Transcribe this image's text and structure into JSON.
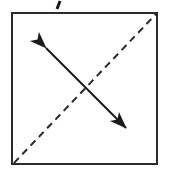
{
  "figure": {
    "canvas": {
      "width": 170,
      "height": 176,
      "background": "#ffffff"
    },
    "colors": {
      "stroke": "#1a1a1a",
      "square_border": "#2b2b2b",
      "dashed_line": "#2b2b2b",
      "arrow": "#1a1a1a",
      "background": "#ffffff"
    },
    "square": {
      "name": "square-outline",
      "x": 11,
      "y": 12,
      "width": 147,
      "height": 153,
      "stroke_width": 2,
      "fill": "none"
    },
    "dashed_diagonal": {
      "name": "dashed-diagonal",
      "x1": 14,
      "y1": 163,
      "x2": 156,
      "y2": 14,
      "stroke_width": 2,
      "dash_length": 7,
      "gap_length": 5,
      "style": "dashed"
    },
    "double_arrow": {
      "name": "double-headed-arrow",
      "x1": 45,
      "y1": 47,
      "x2": 127,
      "y2": 129,
      "stroke_width": 2,
      "style": "solid",
      "arrowheads": [
        "start",
        "end"
      ],
      "head_length": 12,
      "head_width": 9
    },
    "tick_mark": {
      "name": "tick-mark",
      "x1": 60,
      "y1": 1,
      "x2": 57,
      "y2": 9,
      "stroke_width": 3
    }
  }
}
